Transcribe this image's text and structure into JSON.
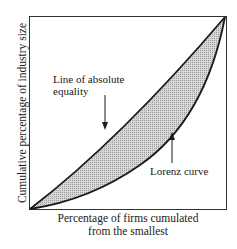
{
  "diagram": {
    "type": "lorenz-curve",
    "y_axis_label": "Cumulative percentage of industry size",
    "x_axis_label_line1": "Percentage of firms cumulated",
    "x_axis_label_line2": "from the smallest",
    "annotations": {
      "equality_line_line1": "Line of absolute",
      "equality_line_line2": "equality",
      "lorenz_curve": "Lorenz curve"
    },
    "colors": {
      "line": "#1a1a1a",
      "shaded_area": "#c8c8c8",
      "background": "#ffffff"
    }
  }
}
